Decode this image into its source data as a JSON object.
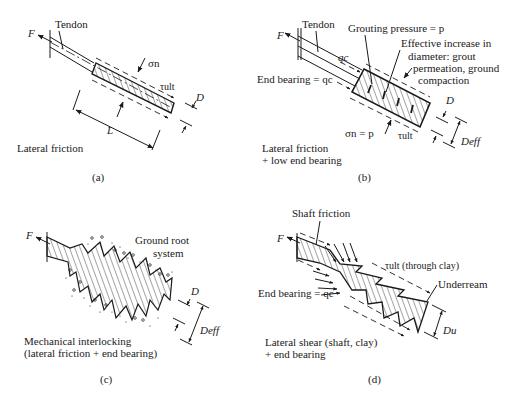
{
  "panels": [
    {
      "id": "a",
      "caption": "(a)",
      "description": "Lateral friction",
      "labels": {
        "force": "F",
        "tendon": "Tendon",
        "normal_stress": "σn",
        "shear": "τult",
        "diameter": "D",
        "length": "L"
      }
    },
    {
      "id": "b",
      "caption": "(b)",
      "description_lines": [
        "Lateral friction",
        "+ low end bearing"
      ],
      "labels": {
        "force": "F",
        "tendon": "Tendon",
        "grouting": "Grouting pressure = p",
        "effective_lines": [
          "Effective increase in",
          "diameter: grout",
          "permeation, ground",
          "compaction"
        ],
        "qc": "qc",
        "end_bearing": "End bearing = qc",
        "normal_stress": "σn = p",
        "shear": "τult",
        "diameter": "D",
        "diameter_eff": "Deff"
      }
    },
    {
      "id": "c",
      "caption": "(c)",
      "description_lines": [
        "Mechanical interlocking",
        "(lateral friction + end bearing)"
      ],
      "labels": {
        "force": "F",
        "root_lines": [
          "Ground root",
          "system"
        ],
        "diameter": "D",
        "diameter_eff": "Deff"
      }
    },
    {
      "id": "d",
      "caption": "(d)",
      "description_lines": [
        "Lateral shear (shaft, clay)",
        "+ end bearing"
      ],
      "labels": {
        "force": "F",
        "shaft_friction": "Shaft friction",
        "shear": "τult (through clay)",
        "underream": "Underream",
        "end_bearing": "End bearing = qc",
        "diameter_u": "Du"
      }
    }
  ]
}
